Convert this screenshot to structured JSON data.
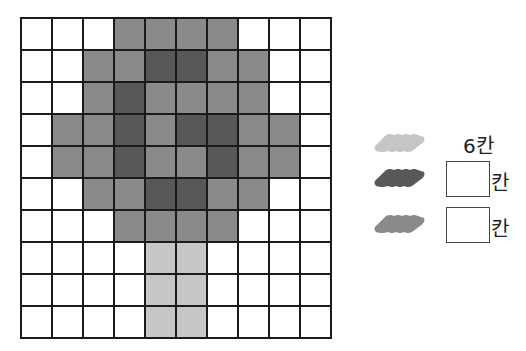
{
  "colors": {
    "W": "#ffffff",
    "M": "#8a8a8a",
    "D": "#585858",
    "L": "#c6c6c6"
  },
  "grid": {
    "rows": [
      [
        "W",
        "W",
        "W",
        "M",
        "M",
        "M",
        "M",
        "W",
        "W",
        "W"
      ],
      [
        "W",
        "W",
        "M",
        "M",
        "D",
        "D",
        "M",
        "M",
        "W",
        "W"
      ],
      [
        "W",
        "W",
        "M",
        "D",
        "M",
        "M",
        "M",
        "M",
        "W",
        "W"
      ],
      [
        "W",
        "M",
        "M",
        "D",
        "M",
        "D",
        "D",
        "M",
        "M",
        "W"
      ],
      [
        "W",
        "M",
        "M",
        "D",
        "M",
        "M",
        "D",
        "M",
        "M",
        "W"
      ],
      [
        "W",
        "W",
        "M",
        "M",
        "D",
        "D",
        "M",
        "M",
        "W",
        "W"
      ],
      [
        "W",
        "W",
        "W",
        "M",
        "M",
        "M",
        "M",
        "W",
        "W",
        "W"
      ],
      [
        "W",
        "W",
        "W",
        "W",
        "L",
        "L",
        "W",
        "W",
        "W",
        "W"
      ],
      [
        "W",
        "W",
        "W",
        "W",
        "L",
        "L",
        "W",
        "W",
        "W",
        "W"
      ],
      [
        "W",
        "W",
        "W",
        "W",
        "L",
        "L",
        "W",
        "W",
        "W",
        "W"
      ]
    ]
  },
  "legend": [
    {
      "color_key": "L",
      "value": "6칸",
      "has_box": false
    },
    {
      "color_key": "D",
      "value": "",
      "unit": "칸",
      "has_box": true
    },
    {
      "color_key": "M",
      "value": "",
      "unit": "칸",
      "has_box": true
    }
  ]
}
